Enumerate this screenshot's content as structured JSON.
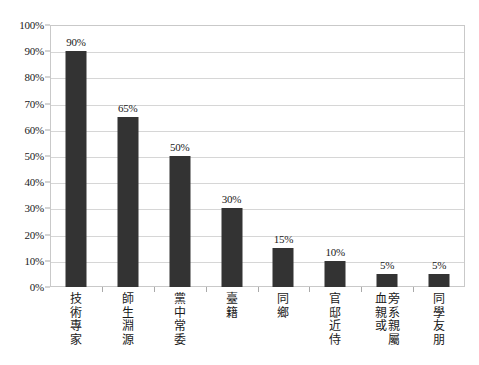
{
  "chart_data": {
    "type": "bar",
    "title": "",
    "subtitle": "",
    "xlabel": "",
    "ylabel": "",
    "ylim": [
      0,
      100
    ],
    "grid": true,
    "legend": false,
    "orientation": "vertical",
    "bar_color": "#333333",
    "plot_border_color": "#c9c9c9",
    "gridline_color": "#d6d6d6",
    "categories": [
      "技術專家",
      "師生淵源",
      "黨中常委",
      "臺籍",
      "同鄉",
      "官邸近侍",
      "旁系親屬或血親",
      "同學友朋"
    ],
    "values": [
      90,
      65,
      50,
      30,
      15,
      10,
      5,
      5
    ],
    "data_labels": [
      "90%",
      "65%",
      "50%",
      "30%",
      "15%",
      "10%",
      "5%",
      "5%"
    ],
    "ytick_labels": [
      "0%",
      "10%",
      "20%",
      "30%",
      "40%",
      "50%",
      "60%",
      "70%",
      "80%",
      "90%",
      "100%"
    ],
    "ytick_values": [
      0,
      10,
      20,
      30,
      40,
      50,
      60,
      70,
      80,
      90,
      100
    ],
    "category_label_columns": [
      [
        "技術專家"
      ],
      [
        "師生淵源"
      ],
      [
        "黨中常委"
      ],
      [
        "臺籍"
      ],
      [
        "同鄉"
      ],
      [
        "官邸近侍"
      ],
      [
        "旁系親屬",
        "血親或"
      ],
      [
        "同學友朋"
      ]
    ]
  }
}
